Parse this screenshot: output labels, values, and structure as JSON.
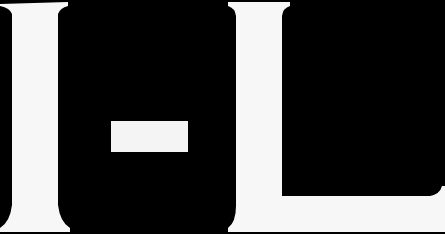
{
  "image": {
    "text": "I-L",
    "glyphs": [
      "I",
      "-",
      "L"
    ],
    "style": "white serif letterforms on black background",
    "colors": {
      "background": "#000000",
      "glyph": "#f7f7f7"
    }
  }
}
